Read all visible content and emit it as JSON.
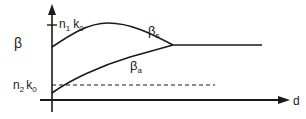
{
  "diagram": {
    "y_axis_label": "β",
    "x_axis_label": "d",
    "upper_tick_label": {
      "base": "n",
      "sub1": "1",
      "mid": "k",
      "sub2": "0"
    },
    "lower_tick_label": {
      "base": "n",
      "sub1": "2",
      "mid": "k",
      "sub2": "0"
    },
    "curve_symmetric_label": {
      "base": "β",
      "sub": "s"
    },
    "curve_antisymmetric_label": {
      "base": "β",
      "sub": "a"
    },
    "colors": {
      "line": "#1a1a1a",
      "background": "#ffffff"
    }
  }
}
